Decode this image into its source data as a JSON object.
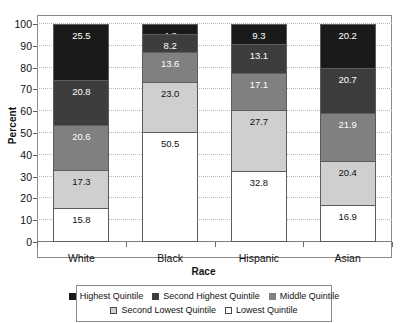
{
  "chart_data": {
    "type": "bar",
    "subtype": "stacked-percent",
    "title": "",
    "xlabel": "Race",
    "ylabel": "Percent",
    "ylim": [
      0,
      100
    ],
    "yticks": [
      0,
      10,
      20,
      30,
      40,
      50,
      60,
      70,
      80,
      90,
      100
    ],
    "grid": true,
    "legend_position": "bottom",
    "categories": [
      "White",
      "Black",
      "Hispanic",
      "Asian"
    ],
    "series": [
      {
        "name": "Highest Quintile",
        "color": "#1a1a1a",
        "swatch": "filled",
        "label_color": "#ffffff",
        "values": [
          25.5,
          4.8,
          9.3,
          20.2
        ]
      },
      {
        "name": "Second Highest Quintile",
        "color": "#3d3d3d",
        "swatch": "filled",
        "label_color": "#ffffff",
        "values": [
          20.8,
          8.2,
          13.1,
          20.7
        ]
      },
      {
        "name": "Middle Quintile",
        "color": "#808080",
        "swatch": "filled",
        "label_color": "#ffffff",
        "values": [
          20.6,
          13.6,
          17.1,
          21.9
        ]
      },
      {
        "name": "Second Lowest Quintile",
        "color": "#cfcfcf",
        "swatch": "outlined",
        "label_color": "#111111",
        "values": [
          17.3,
          23.0,
          27.7,
          20.4
        ]
      },
      {
        "name": "Lowest Quintile",
        "color": "#ffffff",
        "swatch": "outlined",
        "label_color": "#111111",
        "values": [
          15.8,
          50.5,
          32.8,
          16.9
        ]
      }
    ]
  }
}
